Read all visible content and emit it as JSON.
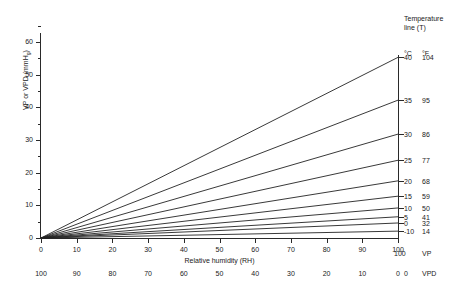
{
  "chart_data": {
    "type": "line",
    "title": "",
    "xlabel": "Relative humidity (RH)",
    "ylabel": "VP or VPD (mmHg)",
    "xlim": [
      0,
      100
    ],
    "ylim": [
      0,
      60
    ],
    "grid": false,
    "legend_position": "right",
    "x_ticks": [
      "0",
      "10",
      "20",
      "30",
      "40",
      "50",
      "60",
      "70",
      "80",
      "90",
      "100"
    ],
    "x_tick_values": [
      0,
      10,
      20,
      30,
      40,
      50,
      60,
      70,
      80,
      90,
      100
    ],
    "x_ticks_secondary": [
      "100",
      "90",
      "80",
      "70",
      "60",
      "50",
      "40",
      "30",
      "20",
      "10",
      "0"
    ],
    "y_ticks": [
      "0",
      "10",
      "20",
      "30",
      "40",
      "50",
      "60"
    ],
    "y_tick_values": [
      0,
      10,
      20,
      30,
      40,
      50,
      60
    ],
    "y_minor_tick_values": [
      5,
      15,
      25,
      35,
      45,
      55,
      65
    ],
    "axis_end_label_vp": "VP",
    "axis_end_label_vpd": "VPD",
    "axis_end_value_vp": "100",
    "axis_end_value_vpd": "0",
    "series": [
      {
        "name": "40",
        "name_f": "104",
        "values": [
          0,
          55.3
        ]
      },
      {
        "name": "35",
        "name_f": "95",
        "values": [
          0,
          42.2
        ]
      },
      {
        "name": "30",
        "name_f": "86",
        "values": [
          0,
          31.8
        ]
      },
      {
        "name": "25",
        "name_f": "77",
        "values": [
          0,
          23.8
        ]
      },
      {
        "name": "20",
        "name_f": "68",
        "values": [
          0,
          17.5
        ]
      },
      {
        "name": "15",
        "name_f": "59",
        "values": [
          0,
          12.8
        ]
      },
      {
        "name": "10",
        "name_f": "50",
        "values": [
          0,
          9.2
        ]
      },
      {
        "name": "5",
        "name_f": "41",
        "values": [
          0,
          6.5
        ]
      },
      {
        "name": "0",
        "name_f": "32",
        "values": [
          0,
          4.6
        ]
      },
      {
        "name": "-10",
        "name_f": "14",
        "values": [
          0,
          2.1
        ]
      }
    ],
    "line_color": "#222222"
  },
  "legend": {
    "title_line1": "Temperature",
    "title_line2": "line (T)",
    "header_c": "°C",
    "header_f": "°F"
  },
  "colors": {
    "axis": "#2a2a2a",
    "line": "#222222",
    "text": "#1a1a1a",
    "background": "#ffffff"
  }
}
